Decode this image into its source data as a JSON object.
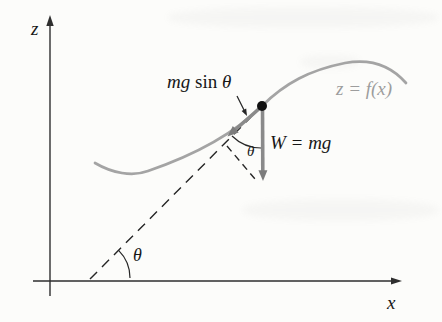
{
  "labels": {
    "z_axis": "z",
    "x_axis": "x",
    "curve": "z = f(x)",
    "weight": "W = mg",
    "component_coef": "mg",
    "component_fn": "sin",
    "component_angle": "θ",
    "theta_at_point": "θ",
    "theta_at_axis": "θ"
  },
  "colors": {
    "background": "#fcfcfa",
    "axis": "#2e2e2e",
    "curve": "#a4a4a4",
    "curve_label": "#9d9d9d",
    "vector": "#8a8a8a",
    "vector_head": "#7c7c7c",
    "annotation": "#262626",
    "text": "#171717"
  }
}
